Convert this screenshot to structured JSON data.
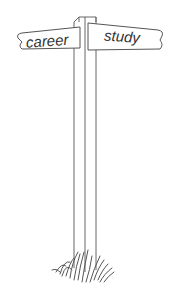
{
  "illustration": {
    "subject": "signpost",
    "signs": [
      {
        "label": "career",
        "direction": "left"
      },
      {
        "label": "study",
        "direction": "right"
      }
    ],
    "colors": {
      "background": "#ffffff",
      "stroke": "#555555",
      "text": "#333333"
    }
  }
}
